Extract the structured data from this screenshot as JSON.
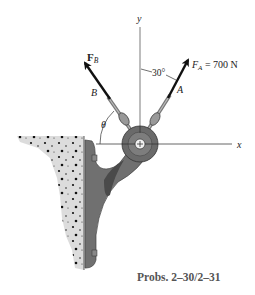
{
  "diagram": {
    "axes": {
      "x_label": "x",
      "y_label": "y"
    },
    "forces": [
      {
        "id": "A",
        "symbol": "F",
        "subscript": "A",
        "bold": false,
        "label_suffix": " = 700 N",
        "magnitude": "700 N",
        "cable_label": "A",
        "angle_from_y": "30°"
      },
      {
        "id": "B",
        "symbol": "F",
        "subscript": "B",
        "bold": true,
        "label_suffix": "",
        "cable_label": "B",
        "angle_from_x": "θ"
      }
    ],
    "angle_labels": {
      "a_angle": "30°",
      "b_angle": "θ"
    },
    "caption": "Probs. 2–30/2–31",
    "colors": {
      "axis": "#9a9a9a",
      "arrow": "#111111",
      "bracket": "#6e6e6e",
      "bracket_dark": "#4a4a4a",
      "wall_fill": "#d9d9d9",
      "wall_dots": "#111111"
    }
  }
}
